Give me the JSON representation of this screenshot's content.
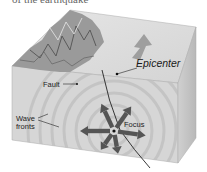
{
  "caption_partial": "of the earthquake",
  "labels": {
    "epicenter": "Epicenter",
    "fault": "Fault",
    "wave_fronts_line1": "Wave",
    "wave_fronts_line2": "fronts",
    "focus": "Focus"
  },
  "colors": {
    "top_face": "#dcdcdc",
    "front_face": "#d2d2d2",
    "right_face": "#c4c4c4",
    "mountains": "#8a8a8a",
    "arrows": "#555555",
    "fault_line": "#222222",
    "wave_rings": "#bcbcbc"
  }
}
